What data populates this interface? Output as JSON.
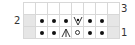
{
  "chart": {
    "columns": 8,
    "rows": [
      {
        "number": "3",
        "label_side": "right",
        "cells": [
          "empty",
          "empty",
          "empty",
          "empty",
          "empty",
          "empty",
          "empty",
          "empty"
        ]
      },
      {
        "number": "2",
        "label_side": "left",
        "cells": [
          "no-stitch",
          "purl",
          "purl",
          "purl",
          "slip-purlwise",
          "purl",
          "purl",
          "no-stitch"
        ]
      },
      {
        "number": "1",
        "label_side": "right",
        "cells": [
          "no-stitch",
          "purl",
          "purl",
          "central-double-decrease",
          "yarn-over",
          "purl",
          "purl",
          "no-stitch"
        ]
      }
    ]
  },
  "labels": {
    "row3": "3",
    "row2": "2",
    "row1": "1"
  },
  "colors": {
    "no_stitch": "#e6e6e6",
    "grid": "#d8d8d8",
    "symbol": "#111111"
  }
}
